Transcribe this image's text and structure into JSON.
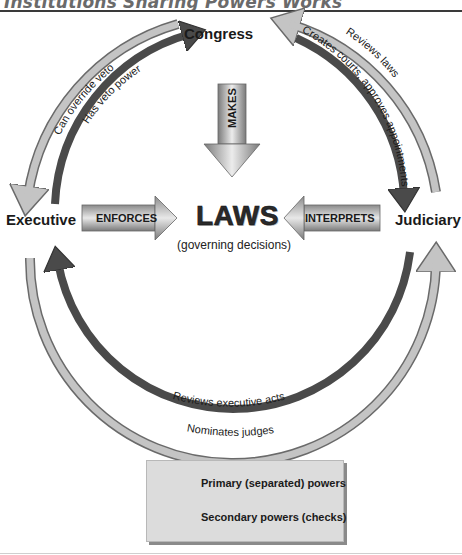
{
  "header": {
    "title": "Institutions Sharing Powers Works"
  },
  "nodes": {
    "congress": "Congress",
    "executive": "Executive",
    "judiciary": "Judiciary"
  },
  "center": {
    "title": "LAWS",
    "subtitle": "(governing decisions)"
  },
  "primary_arrows": {
    "makes": "MAKES",
    "enforces": "ENFORCES",
    "interprets": "INTERPRETS"
  },
  "check_arrows": {
    "can_override_veto": "Can override veto",
    "has_veto_power": "Has veto power",
    "creates_courts": "Creates courts, approves appointments",
    "reviews_laws": "Reviews laws",
    "reviews_executive_acts": "Reviews executive acts",
    "nominates_judges": "Nominates judges"
  },
  "legend": {
    "primary": "Primary (separated) powers",
    "secondary": "Secondary powers (checks)"
  },
  "colors": {
    "dark_arc": "#4a4a4a",
    "light_arc": "#c4c4c4",
    "arc_outline": "#6a6a6a",
    "legend_bg": "#dcdcdc"
  }
}
